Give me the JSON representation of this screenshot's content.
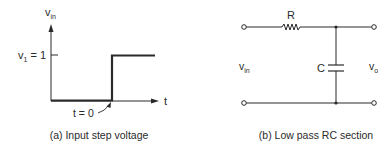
{
  "figure_a": {
    "y_axis_label": "v",
    "y_axis_label_sub": "in",
    "level_label_prefix": "v",
    "level_label_sub": "1",
    "level_label_suffix": " = 1",
    "x_axis_label": "t",
    "step_time_label": "t = 0",
    "caption": "(a)  Input step voltage"
  },
  "figure_b": {
    "resistor_label": "R",
    "capacitor_label": "C",
    "input_label": "v",
    "input_label_sub": "in",
    "output_label": "v",
    "output_label_sub": "o",
    "caption": "(b)  Low pass RC section"
  },
  "colors": {
    "line": "#2a2a2a",
    "background": "#ffffff"
  }
}
